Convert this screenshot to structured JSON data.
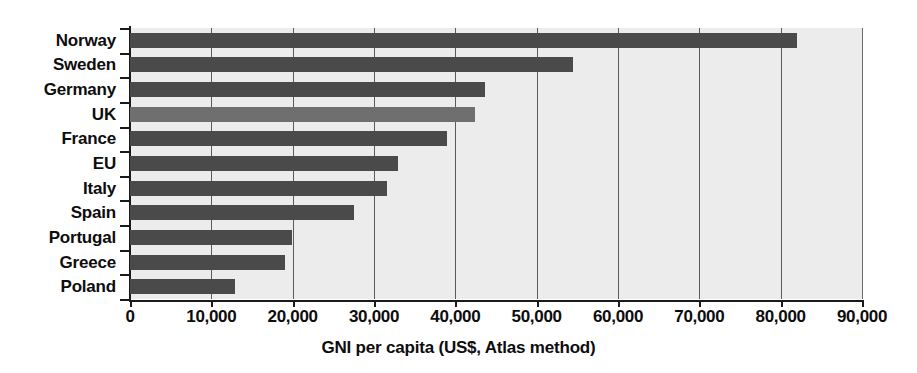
{
  "chart_data": {
    "type": "bar",
    "orientation": "horizontal",
    "title": "",
    "xlabel": "GNI per capita (US$, Atlas method)",
    "ylabel": "",
    "xlim": [
      0,
      90000
    ],
    "xticks": [
      0,
      10000,
      20000,
      30000,
      40000,
      50000,
      60000,
      70000,
      80000,
      90000
    ],
    "xtick_labels": [
      "0",
      "10,000",
      "20,000",
      "30,000",
      "40,000",
      "50,000",
      "60,000",
      "70,000",
      "80,000",
      "90,000"
    ],
    "grid": "vertical",
    "legend": "none",
    "categories": [
      "Norway",
      "Sweden",
      "Germany",
      "UK",
      "France",
      "EU",
      "Italy",
      "Spain",
      "Portugal",
      "Greece",
      "Poland"
    ],
    "values": [
      82000,
      54500,
      43600,
      42400,
      39000,
      33000,
      31600,
      27500,
      19900,
      19000,
      12900
    ],
    "highlighted_category": "UK",
    "colors": {
      "bar": "#4a4a4a",
      "bar_highlight": "#6f6f6f",
      "plot_background": "#ececec",
      "gridline": "#5a5a5a",
      "axis": "#1a1a1a",
      "text": "#0d0d0d",
      "page_background": "#ffffff"
    }
  },
  "title_sliver": ""
}
